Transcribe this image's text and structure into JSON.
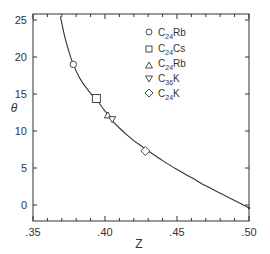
{
  "chart_data": {
    "type": "scatter",
    "title": "",
    "xlabel": "Z",
    "ylabel": "θ",
    "xlim": [
      0.35,
      0.5
    ],
    "ylim": [
      -2,
      26
    ],
    "xticks": [
      ".35",
      ".40",
      ".45",
      ".50"
    ],
    "yticks": [
      "0",
      "5",
      "10",
      "15",
      "20",
      "25"
    ],
    "grid": false,
    "legend_position": "upper-right inside",
    "series": [
      {
        "name": "C24Rb",
        "formula": {
          "base": "C",
          "sub": "24",
          "rest": "Rb"
        },
        "marker": "circle",
        "x": [
          0.378
        ],
        "y": [
          19.0
        ]
      },
      {
        "name": "C24Cs",
        "formula": {
          "base": "C",
          "sub": "24",
          "rest": "Cs"
        },
        "marker": "square",
        "x": [
          0.394
        ],
        "y": [
          14.4
        ]
      },
      {
        "name": "C24Rb",
        "formula": {
          "base": "C",
          "sub": "24",
          "rest": "Rb"
        },
        "marker": "triangle-up",
        "x": [
          0.402
        ],
        "y": [
          12.1
        ]
      },
      {
        "name": "C36K",
        "formula": {
          "base": "C",
          "sub": "36",
          "rest": "K"
        },
        "marker": "triangle-down",
        "x": [
          0.405
        ],
        "y": [
          11.6
        ]
      },
      {
        "name": "C24K",
        "formula": {
          "base": "C",
          "sub": "24",
          "rest": "K"
        },
        "marker": "diamond",
        "x": [
          0.428
        ],
        "y": [
          7.3
        ]
      }
    ],
    "curve": {
      "name": "theory",
      "x": [
        0.369,
        0.372,
        0.375,
        0.378,
        0.382,
        0.386,
        0.39,
        0.394,
        0.398,
        0.402,
        0.406,
        0.41,
        0.415,
        0.42,
        0.425,
        0.43,
        0.44,
        0.45,
        0.46,
        0.47,
        0.48,
        0.49,
        0.5
      ],
      "y": [
        25.5,
        22.8,
        20.7,
        19.0,
        17.3,
        16.1,
        15.1,
        14.3,
        13.2,
        12.2,
        11.2,
        10.4,
        9.5,
        8.7,
        8.0,
        7.3,
        6.0,
        4.8,
        3.7,
        2.6,
        1.6,
        0.6,
        -0.4
      ]
    }
  },
  "axes": {
    "x_label": "Z",
    "y_label": "θ",
    "x_tick_labels": [
      ".35",
      ".40",
      ".45",
      ".50"
    ],
    "y_tick_labels": [
      "0",
      "5",
      "10",
      "15",
      "20",
      "25"
    ]
  },
  "legend": [
    {
      "marker": "circle-icon",
      "base": "C",
      "sub": "24",
      "rest": "Rb"
    },
    {
      "marker": "square-icon",
      "base": "C",
      "sub": "24",
      "rest": "Cs"
    },
    {
      "marker": "triangle-up-icon",
      "base": "C",
      "sub": "24",
      "rest": "Rb"
    },
    {
      "marker": "triangle-down-icon",
      "base": "C",
      "sub": "36",
      "rest": "K"
    },
    {
      "marker": "diamond-icon",
      "base": "C",
      "sub": "24",
      "rest": "K"
    }
  ],
  "colors": {
    "ink": "#333333",
    "background": "#ffffff"
  }
}
